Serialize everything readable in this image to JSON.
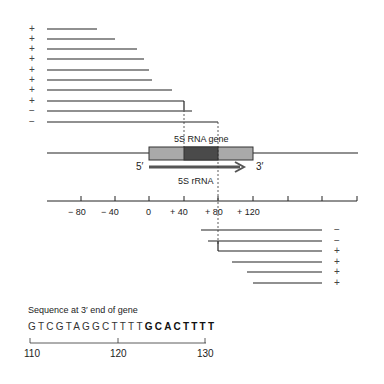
{
  "diagram": {
    "gene_label": "5S RNA gene",
    "rna_label": "5S rRNA",
    "five_prime": "5′",
    "three_prime": "3′",
    "axis": {
      "ticks": [
        "− 80",
        "− 40",
        "0",
        "+ 40",
        "+ 80",
        "+ 120"
      ],
      "tick_values": [
        -80,
        -40,
        0,
        40,
        80,
        120,
        160,
        200,
        240
      ]
    },
    "deletions_5prime": [
      {
        "sign": "+",
        "end": -61
      },
      {
        "sign": "+",
        "end": -40
      },
      {
        "sign": "+",
        "end": -14
      },
      {
        "sign": "+",
        "end": -6
      },
      {
        "sign": "+",
        "end": 0
      },
      {
        "sign": "+",
        "end": 3
      },
      {
        "sign": "+",
        "end": 27
      },
      {
        "sign": "+",
        "end": 80
      },
      {
        "sign": "−",
        "end": 91
      },
      {
        "sign": "−",
        "end": 91
      }
    ],
    "deletions_3prime": [
      {
        "sign": "−",
        "start": 71
      },
      {
        "sign": "−",
        "start": 74
      },
      {
        "sign": "+",
        "start": 80
      },
      {
        "sign": "+",
        "start": 94
      },
      {
        "sign": "+",
        "start": 110
      },
      {
        "sign": "+",
        "start": 116
      }
    ],
    "sequence": {
      "title": "Sequence at 3′ end of gene",
      "plain": "GTCGTAGGCTTTT",
      "bold": "GCACTTTT",
      "scale_labels": [
        "110",
        "120",
        "130"
      ]
    }
  }
}
